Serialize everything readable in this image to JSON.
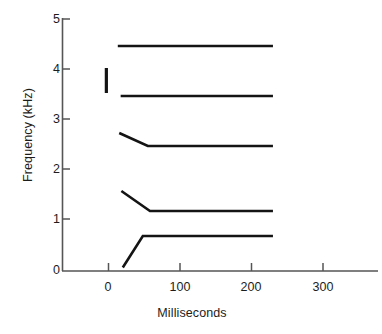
{
  "chart_data": {
    "type": "line",
    "title": "",
    "xlabel": "Milliseconds",
    "ylabel": "Frequency (kHz)",
    "xlim": [
      -20,
      375
    ],
    "ylim": [
      0,
      5.2
    ],
    "xticks": [
      0,
      100,
      200,
      300
    ],
    "xtick_labels": [
      "0",
      "100",
      "200",
      "300"
    ],
    "yticks": [
      0,
      1,
      2,
      3,
      4,
      5
    ],
    "ytick_labels": [
      "0",
      "1",
      "2",
      "3",
      "4",
      "5"
    ],
    "grid": false,
    "legend": "none",
    "line_color": "#141414",
    "axis_color": "#555555",
    "series": [
      {
        "name": "F5",
        "x": [
          13,
          230
        ],
        "values": [
          4.5,
          4.5
        ]
      },
      {
        "name": "F4",
        "x": [
          17,
          230
        ],
        "values": [
          3.5,
          3.5
        ]
      },
      {
        "name": "F3",
        "x": [
          15,
          55,
          230
        ],
        "values": [
          2.76,
          2.5,
          2.5
        ]
      },
      {
        "name": "F2",
        "x": [
          18,
          58,
          230
        ],
        "values": [
          1.6,
          1.2,
          1.2
        ]
      },
      {
        "name": "F1",
        "x": [
          20,
          48,
          230
        ],
        "values": [
          0.07,
          0.7,
          0.7
        ]
      }
    ],
    "annotations": [
      {
        "name": "burst-bar",
        "type": "vertical-bar",
        "x": -3,
        "y_range": [
          3.56,
          4.06
        ]
      }
    ]
  }
}
